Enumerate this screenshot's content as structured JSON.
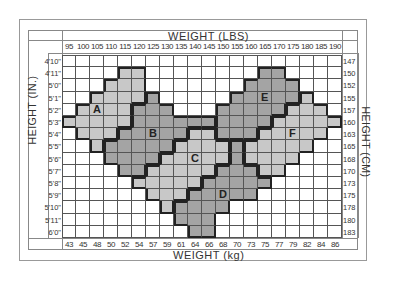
{
  "chart_data": {
    "type": "heatmap",
    "top_axis_label": "WEIGHT (LBS)",
    "bottom_axis_label": "WEIGHT (kg)",
    "left_axis_label": "HEIGHT (IN.)",
    "right_axis_label": "HEIGHT (CM)",
    "weight_lbs": [
      "95",
      "100",
      "105",
      "110",
      "115",
      "120",
      "125",
      "130",
      "135",
      "140",
      "145",
      "150",
      "155",
      "160",
      "165",
      "170",
      "175",
      "180",
      "185",
      "190"
    ],
    "weight_kg": [
      "43",
      "45",
      "48",
      "50",
      "52",
      "54",
      "57",
      "59",
      "61",
      "64",
      "66",
      "68",
      "70",
      "73",
      "75",
      "77",
      "79",
      "82",
      "84",
      "86"
    ],
    "height_in": [
      "4'10\"",
      "4'11\"",
      "5'0\"",
      "5'1\"",
      "5'2\"",
      "5'3\"",
      "5'4\"",
      "5'5\"",
      "5'6\"",
      "5'7\"",
      "5'8\"",
      "5'9\"",
      "5'10\"",
      "5'11\"",
      "6'0\""
    ],
    "height_cm": [
      "147",
      "150",
      "152",
      "155",
      "157",
      "160",
      "163",
      "165",
      "168",
      "170",
      "173",
      "175",
      "178",
      "180",
      "183"
    ],
    "zones": {
      "A": {
        "color": "#c8c8c8",
        "rows": {
          "1": [
            4,
            5
          ],
          "2": [
            3,
            5
          ],
          "3": [
            2,
            5
          ],
          "4": [
            1,
            4
          ],
          "5": [
            0,
            4
          ],
          "6": [
            1,
            3
          ],
          "7": [
            2,
            2
          ]
        }
      },
      "B": {
        "color": "#a4a4a4",
        "rows": {
          "3": [
            6,
            6
          ],
          "4": [
            5,
            7
          ],
          "5": [
            5,
            10
          ],
          "6": [
            4,
            8
          ],
          "7": [
            3,
            7
          ],
          "8": [
            3,
            6
          ],
          "9": [
            4,
            5
          ]
        }
      },
      "C": {
        "color": "#c8c8c8",
        "rows": {
          "6": [
            9,
            10
          ],
          "7": [
            8,
            11
          ],
          "8": [
            7,
            11
          ],
          "9": [
            6,
            10
          ],
          "10": [
            5,
            9
          ],
          "11": [
            6,
            8
          ],
          "12": [
            7,
            7
          ]
        }
      },
      "D": {
        "color": "#a4a4a4",
        "rows": {
          "7": [
            12,
            12
          ],
          "8": [
            12,
            12
          ],
          "9": [
            11,
            13
          ],
          "10": [
            10,
            14
          ],
          "11": [
            9,
            13
          ],
          "12": [
            8,
            11
          ],
          "13": [
            8,
            10
          ],
          "14": [
            9,
            10
          ]
        }
      },
      "E": {
        "color": "#a4a4a4",
        "rows": {
          "1": [
            14,
            15
          ],
          "2": [
            13,
            16
          ],
          "3": [
            12,
            16
          ],
          "4": [
            11,
            15
          ],
          "5": [
            11,
            14
          ],
          "6": [
            11,
            13
          ]
        }
      },
      "F": {
        "color": "#c8c8c8",
        "rows": {
          "3": [
            17,
            17
          ],
          "4": [
            16,
            18
          ],
          "5": [
            15,
            19
          ],
          "6": [
            14,
            18
          ],
          "7": [
            13,
            17
          ],
          "8": [
            13,
            16
          ],
          "9": [
            14,
            15
          ]
        }
      }
    },
    "zone_labels": [
      {
        "label": "A",
        "row": 4,
        "col": 2
      },
      {
        "label": "B",
        "row": 6,
        "col": 6
      },
      {
        "label": "C",
        "row": 8,
        "col": 9
      },
      {
        "label": "D",
        "row": 11,
        "col": 11
      },
      {
        "label": "E",
        "row": 3,
        "col": 14
      },
      {
        "label": "F",
        "row": 6,
        "col": 16
      }
    ],
    "grid": true
  }
}
